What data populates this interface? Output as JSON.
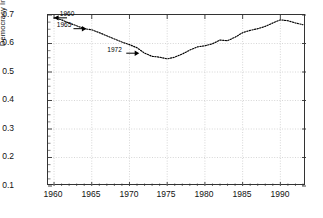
{
  "chart_data": {
    "type": "line",
    "title": "",
    "xlabel": "",
    "ylabel": "Democracy Index",
    "xlim": [
      1959.2,
      1993.4
    ],
    "ylim": [
      0.1,
      0.7
    ],
    "grid": true,
    "legend": null,
    "line_style": "dotted",
    "line_color": "#000000",
    "x_major_ticks": [
      1960,
      1965,
      1970,
      1975,
      1980,
      1985,
      1990
    ],
    "x_tick_labels": [
      "1960",
      "1965",
      "1970",
      "1975",
      "1980",
      "1985",
      "1990"
    ],
    "x_minor_tick_step": 1,
    "y_ticks": [
      0.1,
      0.2,
      0.3,
      0.4,
      0.5,
      0.6,
      0.7
    ],
    "y_tick_labels": [
      "0.1",
      "0.2",
      "0.3",
      "0.4",
      "0.5",
      "0.6",
      "0.7"
    ],
    "x": [
      1960,
      1961,
      1962,
      1963,
      1964,
      1965,
      1966,
      1967,
      1968,
      1969,
      1970,
      1971,
      1972,
      1973,
      1974,
      1975,
      1976,
      1977,
      1978,
      1979,
      1980,
      1981,
      1982,
      1983,
      1984,
      1985,
      1986,
      1987,
      1988,
      1989,
      1990,
      1991,
      1992,
      1993
    ],
    "values": [
      0.69,
      0.683,
      0.672,
      0.662,
      0.652,
      0.648,
      0.638,
      0.627,
      0.616,
      0.605,
      0.596,
      0.585,
      0.566,
      0.555,
      0.552,
      0.546,
      0.552,
      0.563,
      0.577,
      0.588,
      0.592,
      0.599,
      0.612,
      0.61,
      0.622,
      0.638,
      0.646,
      0.652,
      0.66,
      0.672,
      0.683,
      0.68,
      0.672,
      0.666
    ],
    "annotations": [
      {
        "label": "1960",
        "year": 1960,
        "value": 0.69,
        "arrow_direction": "left",
        "text_x": 1960.9,
        "text_y": 0.695
      },
      {
        "label": "1965",
        "year": 1964.3,
        "value": 0.652,
        "arrow_direction": "right",
        "text_x": 1960.5,
        "text_y": 0.657
      },
      {
        "label": "1972",
        "year": 1971.3,
        "value": 0.566,
        "arrow_direction": "right",
        "text_x": 1967.2,
        "text_y": 0.571
      }
    ]
  },
  "axes": {
    "y_title": "Democracy Index",
    "y_labels": [
      "0.7",
      "0.6",
      "0.5",
      "0.4",
      "0.3",
      "0.2",
      "0.1"
    ],
    "x_labels": [
      "1960",
      "1965",
      "1970",
      "1975",
      "1980",
      "1985",
      "1990"
    ]
  },
  "annotation_labels": [
    "1960",
    "1965",
    "1972"
  ],
  "colors": {
    "line": "#000000",
    "grid": "#cccccc",
    "frame": "#333333",
    "text": "#111111",
    "background": "#ffffff"
  }
}
